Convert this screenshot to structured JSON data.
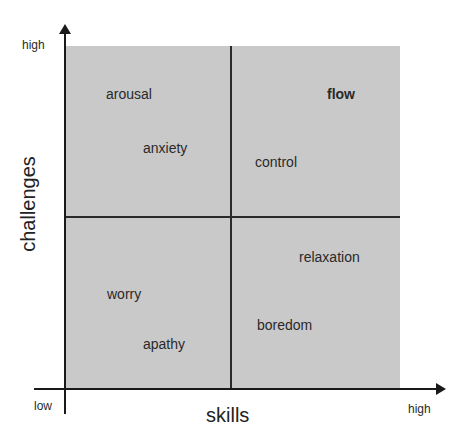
{
  "diagram": {
    "type": "quadrant",
    "title": "",
    "y_axis": {
      "title": "challenges",
      "low": "",
      "high": "high"
    },
    "x_axis": {
      "title": "skills",
      "low": "low",
      "high": "high"
    },
    "colors": {
      "background": "#c9c9c9",
      "lines": "#2a2a2a"
    },
    "labels": {
      "arousal": "arousal",
      "anxiety": "anxiety",
      "flow": "flow",
      "control": "control",
      "relaxation": "relaxation",
      "worry": "worry",
      "apathy": "apathy",
      "boredom": "boredom"
    }
  }
}
